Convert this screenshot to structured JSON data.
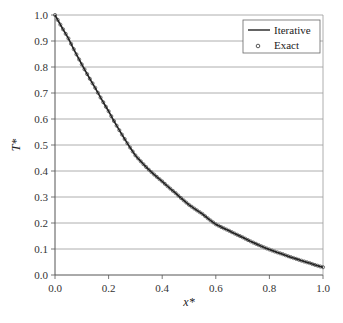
{
  "chart_data": {
    "type": "line",
    "title": "",
    "xlabel": "x*",
    "ylabel": "T*",
    "xlim": [
      0.0,
      1.0
    ],
    "ylim": [
      0.0,
      1.0
    ],
    "x_ticks": [
      "0.0",
      "0.2",
      "0.4",
      "0.6",
      "0.8",
      "1.0"
    ],
    "y_ticks": [
      "0.0",
      "0.1",
      "0.2",
      "0.3",
      "0.4",
      "0.5",
      "0.6",
      "0.7",
      "0.8",
      "0.9",
      "1.0"
    ],
    "grid": {
      "horizontal": true,
      "vertical": false
    },
    "legend_position": "upper right",
    "x": [
      0.0,
      0.05,
      0.1,
      0.15,
      0.2,
      0.25,
      0.3,
      0.35,
      0.4,
      0.45,
      0.5,
      0.55,
      0.6,
      0.65,
      0.7,
      0.75,
      0.8,
      0.85,
      0.9,
      0.95,
      1.0
    ],
    "series": [
      {
        "name": "Iterative",
        "style": "line",
        "color": "#222222",
        "values": [
          1.0,
          0.91,
          0.81,
          0.72,
          0.63,
          0.54,
          0.46,
          0.405,
          0.36,
          0.315,
          0.27,
          0.235,
          0.195,
          0.17,
          0.145,
          0.12,
          0.098,
          0.08,
          0.062,
          0.046,
          0.03
        ]
      },
      {
        "name": "Exact",
        "style": "markers",
        "marker": "open-circle",
        "color": "#555555",
        "values": [
          1.0,
          0.91,
          0.81,
          0.72,
          0.63,
          0.54,
          0.46,
          0.405,
          0.36,
          0.315,
          0.27,
          0.235,
          0.195,
          0.17,
          0.145,
          0.12,
          0.098,
          0.08,
          0.062,
          0.046,
          0.03
        ]
      }
    ]
  },
  "legend": {
    "items": [
      {
        "label": "Iterative",
        "symbol": "line"
      },
      {
        "label": "Exact",
        "symbol": "circle"
      }
    ]
  },
  "axes": {
    "x_title": "x*",
    "y_title": "T*"
  }
}
